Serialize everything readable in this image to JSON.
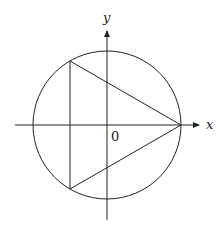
{
  "diagram": {
    "axes": {
      "x_label": "x",
      "y_label": "y",
      "origin_label": "0"
    },
    "geometry": {
      "center_px": [
        107,
        125
      ],
      "radius_px": 74,
      "triangle_vertices_px": [
        [
          181,
          125
        ],
        [
          70,
          61
        ],
        [
          70,
          189
        ]
      ]
    },
    "colors": {
      "stroke": "#222222",
      "background": "#ffffff"
    }
  }
}
